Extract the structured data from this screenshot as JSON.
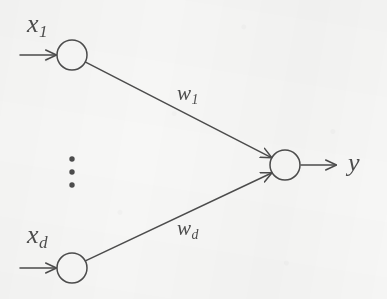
{
  "figure": {
    "type": "neural-network-diagram",
    "background_color": "#f7f7f6",
    "stroke_color": "#4c4c4c",
    "node_fill": "none"
  },
  "nodes": [
    {
      "id": "input-1",
      "label": "x",
      "subscript": "1",
      "cx": 72,
      "cy": 55,
      "r": 15
    },
    {
      "id": "input-d",
      "label": "x",
      "subscript": "d",
      "cx": 72,
      "cy": 268,
      "r": 15
    },
    {
      "id": "output",
      "label": "y",
      "subscript": "",
      "cx": 285,
      "cy": 165,
      "r": 15
    }
  ],
  "edges": [
    {
      "id": "edge-w1",
      "from": "input-1",
      "to": "output",
      "label": "w",
      "subscript": "1"
    },
    {
      "id": "edge-wd",
      "from": "input-d",
      "to": "output",
      "label": "w",
      "subscript": "d"
    }
  ],
  "labels": {
    "input_1": {
      "text": "x",
      "sub": "1"
    },
    "input_d": {
      "text": "x",
      "sub": "d"
    },
    "weight_1": {
      "text": "w",
      "sub": "1"
    },
    "weight_d": {
      "text": "w",
      "sub": "d"
    },
    "output": {
      "text": "y",
      "sub": ""
    }
  },
  "ellipsis": {
    "name": "vertical-ellipsis",
    "dot_count": 3,
    "x": 72,
    "ys": [
      159,
      172,
      185
    ]
  },
  "arrows": {
    "input_1_arrow": {
      "x1": 20,
      "y1": 55,
      "x2": 56,
      "y2": 55
    },
    "input_d_arrow": {
      "x1": 20,
      "y1": 268,
      "x2": 56,
      "y2": 268
    },
    "output_arrow": {
      "x1": 301,
      "y1": 165,
      "x2": 336,
      "y2": 165
    }
  }
}
